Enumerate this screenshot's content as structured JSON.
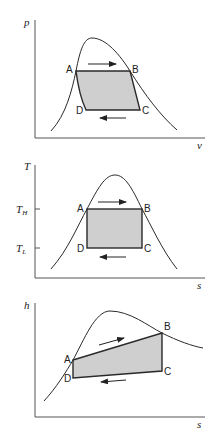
{
  "diagrams": [
    {
      "name": "p-v diagram",
      "y_axis_label": "p",
      "x_axis_label": "v",
      "points": {
        "A": "A",
        "B": "B",
        "C": "C",
        "D": "D"
      }
    },
    {
      "name": "T-s diagram",
      "y_axis_label": "T",
      "x_axis_label": "s",
      "tick_high": {
        "main": "T",
        "sub": "H"
      },
      "tick_low": {
        "main": "T",
        "sub": "L"
      },
      "points": {
        "A": "A",
        "B": "B",
        "C": "C",
        "D": "D"
      }
    },
    {
      "name": "h-s diagram",
      "y_axis_label": "h",
      "x_axis_label": "s",
      "points": {
        "A": "A",
        "B": "B",
        "C": "C",
        "D": "D"
      }
    }
  ],
  "colors": {
    "cycle_fill": "#cfcfcf",
    "line": "#2a2a2a",
    "axis": "#555555"
  }
}
